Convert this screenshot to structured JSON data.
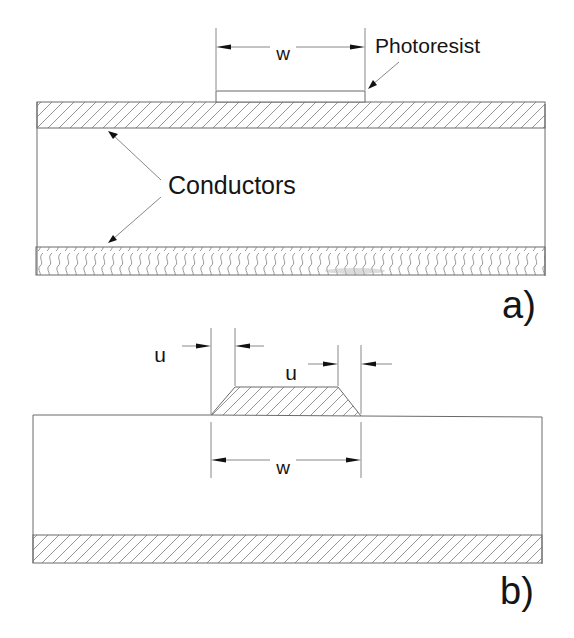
{
  "diagram": {
    "colors": {
      "outline": "#6a6a6a",
      "hatch": "#8a8a8a",
      "text": "#151515",
      "background": "#ffffff"
    },
    "panel_a": {
      "label": "a)",
      "photoresist_label": "Photoresist",
      "conductors_label": "Conductors",
      "width_dimension_label": "w"
    },
    "panel_b": {
      "label": "b)",
      "undercut_left_label": "u",
      "undercut_right_label": "u",
      "width_dimension_label": "w"
    }
  }
}
